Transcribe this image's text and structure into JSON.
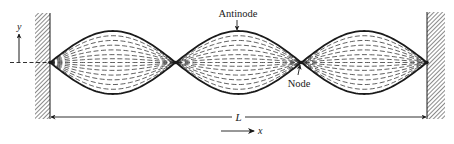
{
  "labels": {
    "antinode": "Antinode",
    "node": "Node",
    "length": "L",
    "x_axis": "x",
    "y_axis": "y"
  },
  "wave": {
    "loops": 3,
    "nodes_count": 4,
    "envelope_style": "solid",
    "intermediate_style": "dashed",
    "intermediate_amplitude_fractions": [
      0.85,
      0.7,
      0.55,
      0.4,
      0.25,
      0.12,
      0.0,
      -0.12,
      -0.25,
      -0.4,
      -0.55,
      -0.7,
      -0.85
    ]
  },
  "colors": {
    "ink": "#1a1a1a",
    "wall_hatch": "#2a2a2a",
    "background": "#ffffff"
  }
}
